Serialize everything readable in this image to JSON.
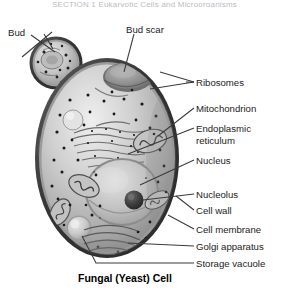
{
  "header": {
    "clipped_text": "SECTION 1  Eukaryotic Cells and Microorganisms"
  },
  "figure": {
    "caption": "Fungal (Yeast) Cell",
    "style": "grayscale shaded biological illustration with leader-line callouts"
  },
  "labels": {
    "left": [
      {
        "id": "bud",
        "text": "Bud",
        "x": 8,
        "y": 27,
        "points_to": "bud-cell"
      }
    ],
    "top": [
      {
        "id": "bud_scar",
        "text": "Bud scar",
        "x": 126,
        "y": 24,
        "points_to": "bud-scar-depression"
      }
    ],
    "right": [
      {
        "id": "ribosomes",
        "text": "Ribosomes",
        "x": 196,
        "y": 77,
        "line_y": 82,
        "line_x1": 186,
        "line_x2": 194,
        "fork": true
      },
      {
        "id": "mitochondrion",
        "text": "Mitochondrion",
        "x": 196,
        "y": 103,
        "line_y": 108,
        "line_x1": 186,
        "line_x2": 194,
        "fork": false
      },
      {
        "id": "endoplasmic",
        "text": "Endoplasmic",
        "x": 196,
        "y": 123,
        "line_y": 128,
        "line_x1": 186,
        "line_x2": 194,
        "fork": false
      },
      {
        "id": "reticulum",
        "text": "reticulum",
        "x": 196,
        "y": 135,
        "line_y": null,
        "line_x1": null,
        "line_x2": null,
        "fork": false
      },
      {
        "id": "nucleus",
        "text": "Nucleus",
        "x": 196,
        "y": 155,
        "line_y": 160,
        "line_x1": 186,
        "line_x2": 194,
        "fork": false
      },
      {
        "id": "nucleolus",
        "text": "Nucleolus",
        "x": 196,
        "y": 189,
        "line_y": 194,
        "line_x1": 186,
        "line_x2": 194,
        "fork": false
      },
      {
        "id": "cell_wall",
        "text": "Cell wall",
        "x": 196,
        "y": 205,
        "line_y": 210,
        "line_x1": 186,
        "line_x2": 194,
        "fork": false
      },
      {
        "id": "cell_membrane",
        "text": "Cell membrane",
        "x": 196,
        "y": 224,
        "line_y": 229,
        "line_x1": 186,
        "line_x2": 194,
        "fork": false
      },
      {
        "id": "golgi",
        "text": "Golgi apparatus",
        "x": 196,
        "y": 241,
        "line_y": 246,
        "line_x1": 186,
        "line_x2": 194,
        "fork": false
      },
      {
        "id": "storage",
        "text": "Storage vacuole",
        "x": 196,
        "y": 258,
        "line_y": 263,
        "line_x1": 186,
        "line_x2": 194,
        "fork": false
      }
    ]
  },
  "caption_pos": {
    "x": 78,
    "y": 272
  },
  "colors": {
    "background": "#ffffff",
    "text": "#1b1b1b",
    "leader_line": "#3a3a3a",
    "cell_wall_outer": "#4a4a4a",
    "cell_wall_dark": "#2e2e2e",
    "cell_membrane": "#8e8e8e",
    "cytoplasm_light": "#d8d8d8",
    "cytoplasm_mid": "#b4b4b4",
    "cytoplasm_dark": "#8d8d8d",
    "nucleus_fill": "#c9c9c9",
    "nucleolus": "#3c3c3c",
    "ribosome_dot": "#1f1f1f",
    "organelle_edge": "#5c5c5c",
    "vacuole_fill": "#cfcfcf",
    "header_text": "#b9bcc4"
  }
}
